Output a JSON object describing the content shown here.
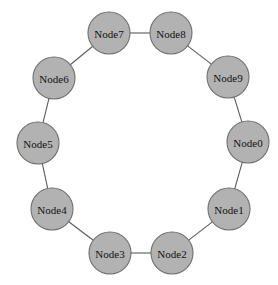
{
  "figure": {
    "background_color": "#ffffff"
  },
  "graph_data": {
    "type": "graph",
    "layout": "circular",
    "directed": false,
    "node_count": 10,
    "edge_count": 10,
    "node_style": {
      "shape": "circle",
      "fill_color": "#b2b2b2",
      "border_color": "#6e6e6e",
      "radius": 21
    },
    "edge_style": {
      "color": "#5a5a5a",
      "width": 1.1
    },
    "nodes": [
      {
        "id": "Node0",
        "label": "Node0",
        "cx": 248,
        "cy": 142,
        "r": 21
      },
      {
        "id": "Node1",
        "label": "Node1",
        "cx": 229,
        "cy": 209,
        "r": 21
      },
      {
        "id": "Node2",
        "label": "Node2",
        "cx": 172,
        "cy": 253,
        "r": 21
      },
      {
        "id": "Node3",
        "label": "Node3",
        "cx": 110,
        "cy": 253,
        "r": 21
      },
      {
        "id": "Node4",
        "label": "Node4",
        "cx": 52,
        "cy": 209,
        "r": 21
      },
      {
        "id": "Node5",
        "label": "Node5",
        "cx": 38,
        "cy": 143,
        "r": 21
      },
      {
        "id": "Node6",
        "label": "Node6",
        "cx": 54,
        "cy": 78,
        "r": 21
      },
      {
        "id": "Node7",
        "label": "Node7",
        "cx": 109,
        "cy": 33,
        "r": 21
      },
      {
        "id": "Node8",
        "label": "Node8",
        "cx": 171,
        "cy": 33,
        "r": 21
      },
      {
        "id": "Node9",
        "label": "Node9",
        "cx": 228,
        "cy": 77,
        "r": 21
      }
    ],
    "edges": [
      {
        "source": "Node0",
        "target": "Node1"
      },
      {
        "source": "Node1",
        "target": "Node2"
      },
      {
        "source": "Node2",
        "target": "Node3"
      },
      {
        "source": "Node3",
        "target": "Node4"
      },
      {
        "source": "Node4",
        "target": "Node5"
      },
      {
        "source": "Node5",
        "target": "Node6"
      },
      {
        "source": "Node6",
        "target": "Node7"
      },
      {
        "source": "Node7",
        "target": "Node8"
      },
      {
        "source": "Node8",
        "target": "Node9"
      },
      {
        "source": "Node9",
        "target": "Node0"
      }
    ]
  }
}
